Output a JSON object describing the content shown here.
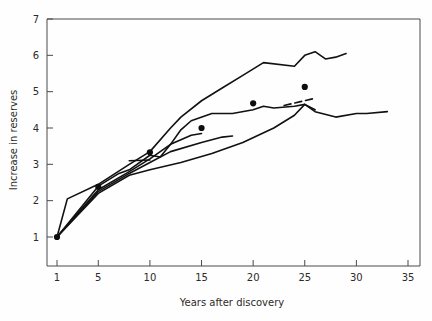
{
  "chart_data": {
    "type": "line",
    "title": "",
    "xlabel": "Years after discovery",
    "ylabel": "Increase in reserves",
    "xlim": [
      1,
      35
    ],
    "ylim": [
      0.45,
      7
    ],
    "grid": false,
    "legend": "none",
    "xticks": [
      1,
      5,
      10,
      15,
      20,
      25,
      30,
      35
    ],
    "xtick_labels": [
      "1",
      "5",
      "10",
      "15",
      "20",
      "25",
      "30",
      "35"
    ],
    "yticks": [
      1,
      2,
      3,
      4,
      5,
      6,
      7
    ],
    "ytick_labels": [
      "1",
      "2",
      "3",
      "4",
      "5",
      "6",
      "7"
    ],
    "series": [
      {
        "name": "upper-envelope",
        "style": "solid",
        "x": [
          1,
          2,
          5,
          8,
          10,
          12,
          13,
          15,
          17,
          19,
          21,
          24,
          25,
          26,
          27,
          28,
          29
        ],
        "values": [
          1.0,
          2.05,
          2.45,
          3.0,
          3.35,
          4.0,
          4.3,
          4.75,
          5.1,
          5.45,
          5.8,
          5.7,
          6.0,
          6.1,
          5.9,
          5.95,
          6.05
        ]
      },
      {
        "name": "second-curve",
        "style": "solid",
        "x": [
          1,
          5,
          7,
          8,
          10,
          11,
          12,
          13,
          14,
          16,
          18,
          20,
          21,
          22,
          24,
          25,
          26,
          28,
          30,
          31,
          33
        ],
        "values": [
          1.0,
          2.4,
          2.75,
          2.85,
          3.25,
          3.2,
          3.55,
          3.95,
          4.2,
          4.4,
          4.4,
          4.5,
          4.6,
          4.55,
          4.6,
          4.65,
          4.45,
          4.3,
          4.4,
          4.4,
          4.45
        ]
      },
      {
        "name": "lower-envelope",
        "style": "solid",
        "x": [
          1,
          5,
          8,
          10,
          13,
          16,
          19,
          22,
          24,
          25,
          26
        ],
        "values": [
          1.0,
          2.2,
          2.7,
          2.85,
          3.05,
          3.3,
          3.6,
          4.0,
          4.35,
          4.65,
          4.5
        ]
      },
      {
        "name": "short-curve-a",
        "style": "solid",
        "x": [
          1,
          5,
          8,
          10,
          12,
          14,
          15
        ],
        "values": [
          1.0,
          2.3,
          2.8,
          3.15,
          3.55,
          3.8,
          3.85
        ]
      },
      {
        "name": "short-curve-b",
        "style": "solid",
        "x": [
          1,
          5,
          8,
          10,
          12,
          15,
          17,
          18
        ],
        "values": [
          1.0,
          2.25,
          2.75,
          3.05,
          3.35,
          3.6,
          3.75,
          3.78
        ]
      },
      {
        "name": "short-dash-segment-mid",
        "style": "solid",
        "x": [
          8,
          10
        ],
        "values": [
          3.1,
          3.12
        ]
      },
      {
        "name": "dashed-segment-upper",
        "style": "dashed",
        "x": [
          23,
          26
        ],
        "values": [
          4.62,
          4.82
        ]
      }
    ],
    "markers": {
      "name": "mean-points",
      "shape": "filled-circle",
      "x": [
        1,
        5,
        10,
        15,
        20,
        25
      ],
      "values": [
        1.0,
        2.38,
        3.33,
        4.0,
        4.68,
        5.13
      ]
    }
  }
}
